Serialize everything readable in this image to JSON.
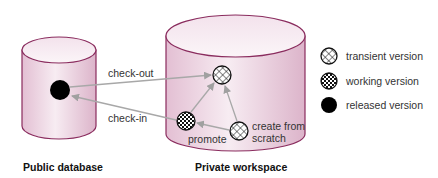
{
  "diagram": {
    "containers": [
      {
        "id": "public",
        "label": "Public database"
      },
      {
        "id": "private",
        "label": "Private workspace"
      }
    ],
    "edges": [
      {
        "from": "released",
        "to": "transient",
        "label": "check-out"
      },
      {
        "from": "working",
        "to": "released",
        "label": "check-in"
      },
      {
        "from": "working",
        "to": "transient",
        "label": ""
      },
      {
        "from": "create",
        "to": "transient",
        "label": ""
      },
      {
        "from": "create",
        "to": "working",
        "label": ""
      }
    ],
    "node_labels": {
      "promote": "promote",
      "create_line1": "create from",
      "create_line2": "scratch"
    },
    "legend": [
      {
        "icon": "transient-version-icon",
        "label": "transient version"
      },
      {
        "icon": "working-version-icon",
        "label": "working version"
      },
      {
        "icon": "released-version-icon",
        "label": "released version"
      }
    ],
    "colors": {
      "cylinder_fill": "#edd6e4",
      "cylinder_stroke": "#8a2c5e",
      "arrow": "#a8a8a8",
      "released": "#000000"
    }
  }
}
